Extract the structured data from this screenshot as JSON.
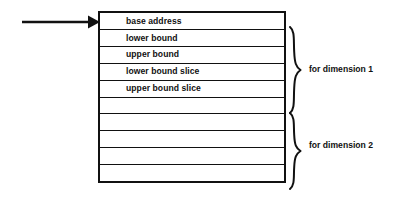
{
  "diagram": {
    "colors": {
      "background": "#ffffff",
      "stroke": "#111111",
      "text": "#111111"
    },
    "pointer": {
      "icon": "arrow-right-icon",
      "target_row_index": 0
    },
    "table": {
      "row_count": 10,
      "rows": [
        {
          "label": "base address"
        },
        {
          "label": "lower bound"
        },
        {
          "label": "upper bound"
        },
        {
          "label": "lower bound slice"
        },
        {
          "label": "upper bound slice"
        },
        {
          "label": ""
        },
        {
          "label": ""
        },
        {
          "label": ""
        },
        {
          "label": ""
        },
        {
          "label": ""
        }
      ]
    },
    "groups": [
      {
        "label": "for dimension 1",
        "brace_icon": "right-curly-brace-icon",
        "first_row_index": 1,
        "last_row_index": 4
      },
      {
        "label": "for dimension 2",
        "brace_icon": "right-curly-brace-icon",
        "first_row_index": 5,
        "last_row_index": 9
      }
    ]
  }
}
